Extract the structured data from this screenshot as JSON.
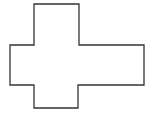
{
  "diagram": {
    "type": "polygon-outline",
    "stroke_color": "#333333",
    "fill_color": "#ffffff",
    "stroke_width": 1.3,
    "points": "34,4 79,4 79,45 144,45 144,85 78,85 78,108 34,108 34,85 10,85 10,45 34,45"
  }
}
